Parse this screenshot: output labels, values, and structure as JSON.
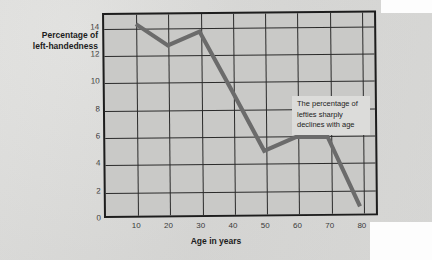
{
  "chart_data": {
    "type": "line",
    "title": "",
    "xlabel": "Age in years",
    "ylabel": "Percentage of left-handedness",
    "ylabel_lines": [
      "Percentage of",
      "left-handedness"
    ],
    "x": [
      10,
      20,
      30,
      40,
      50,
      60,
      70,
      80
    ],
    "values": [
      14.3,
      12.7,
      13.7,
      9.3,
      4.8,
      5.8,
      5.8,
      0.6
    ],
    "series": [
      {
        "name": "Percentage of left-handedness",
        "values": [
          14.3,
          12.7,
          13.7,
          9.3,
          4.8,
          5.8,
          5.8,
          0.6
        ]
      }
    ],
    "xlim": [
      0,
      90
    ],
    "ylim": [
      0,
      15
    ],
    "xticks": [
      10,
      20,
      30,
      40,
      50,
      60,
      70,
      80,
      90
    ],
    "yticks": [
      0,
      2,
      4,
      6,
      8,
      10,
      12,
      14
    ],
    "grid": true,
    "legend": "none",
    "annotations": [
      {
        "text": "The percentage of lefties sharply declines with age",
        "lines": [
          "The percentage of",
          "lefties sharply",
          "declines with age"
        ]
      }
    ],
    "colors": {
      "plot_background": "#c9c9c7",
      "grid": "#2a2a2a",
      "line": "#6b6b6b",
      "axis": "#1d1d1d",
      "annotation_background": "#dcdcda",
      "page_background": "#ececeb"
    }
  }
}
